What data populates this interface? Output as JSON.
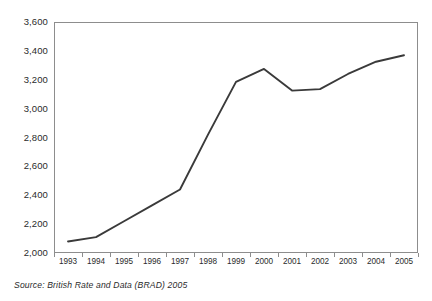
{
  "chart_data": {
    "type": "line",
    "title": "",
    "subtitle": "",
    "xlabel": "",
    "ylabel": "",
    "categories": [
      "1993",
      "1994",
      "1995",
      "1996",
      "1997",
      "1998",
      "1999",
      "2000",
      "2001",
      "2002",
      "2003",
      "2004",
      "2005"
    ],
    "series": [
      {
        "name": "",
        "values": [
          2080,
          2110,
          2220,
          2330,
          2440,
          2820,
          3185,
          3275,
          3125,
          3135,
          3240,
          3325,
          3370
        ],
        "color": "#3a3a3a"
      }
    ],
    "ylim": [
      2000,
      3600
    ],
    "ytick_values": [
      2000,
      2200,
      2400,
      2600,
      2800,
      3000,
      3200,
      3400,
      3600
    ],
    "ytick_labels": [
      "2,000",
      "2,200",
      "2,400",
      "2,600",
      "2,800",
      "3,000",
      "3,200",
      "3,400",
      "3,600"
    ],
    "xtick_labels": [
      "1993",
      "1994",
      "1995",
      "1996",
      "1997",
      "1998",
      "1999",
      "2000",
      "2001",
      "2002",
      "2003",
      "2004",
      "2005"
    ],
    "grid": false,
    "legend": false,
    "legend_position": "none",
    "annotations": []
  },
  "footer": {
    "source_note": "Source: British Rate and Data (BRAD) 2005"
  },
  "style": {
    "background": "#ffffff",
    "frame_color": "#8d8d8d",
    "text_color": "#2b2b2b",
    "line_color": "#3a3a3a"
  }
}
